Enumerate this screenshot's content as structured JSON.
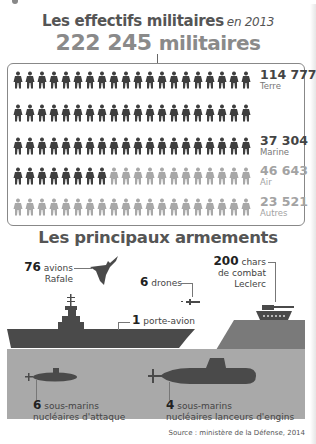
{
  "header": {
    "title": "Les effectifs militaires",
    "year": "en 2013",
    "total_number": "222 245",
    "total_unit": "militaires"
  },
  "effectifs": {
    "soldiers_per_row": 20,
    "rows": [
      {
        "dark": 20,
        "light": 0,
        "number": "114 777",
        "label": "Terre",
        "color": "#444444"
      },
      {
        "dark": 20,
        "light": 0,
        "number": "",
        "label": "",
        "color": "#444444"
      },
      {
        "dark": 20,
        "light": 0,
        "number": "37 304",
        "label": "Marine",
        "color": "#444444"
      },
      {
        "dark": 8,
        "light": 12,
        "number": "46 643",
        "label": "Air",
        "color": "#a3a3a3"
      },
      {
        "dark": 0,
        "light": 20,
        "number": "23 521",
        "label": "Autres",
        "color": "#a3a3a3"
      }
    ],
    "colors": {
      "dark": "#3f3f3f",
      "light": "#a8a8a8"
    }
  },
  "armements": {
    "title": "Les principaux armements",
    "rafale": {
      "count": "76",
      "text1": "avions",
      "text2": "Rafale"
    },
    "drones": {
      "count": "6",
      "text": "drones"
    },
    "chars": {
      "count": "200",
      "text1": "chars",
      "text2": "de combat",
      "text3": "Leclerc"
    },
    "porte_avion": {
      "count": "1",
      "text": "porte-avion"
    },
    "sna": {
      "count": "6",
      "text1": "sous-marins",
      "text2": "nucléaires d'attaque"
    },
    "snle": {
      "count": "4",
      "text1": "sous-marins",
      "text2": "nucléaires lanceurs d'engins"
    }
  },
  "colors": {
    "dark": "#4a4a4a",
    "sea": "#a9a9a9",
    "land": "#7a7a7a",
    "title_gray": "#8a8a8a"
  },
  "source": "Source : ministère de la Défense, 2014"
}
